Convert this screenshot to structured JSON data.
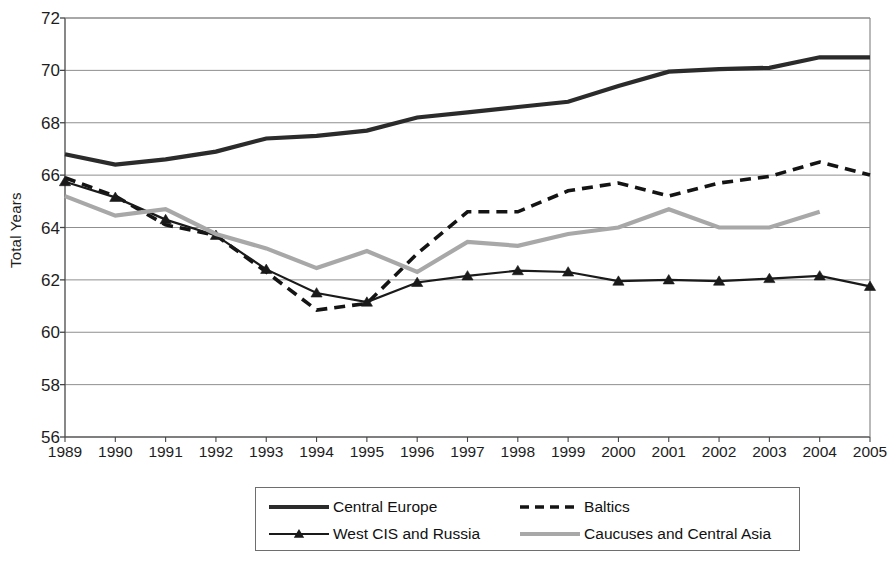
{
  "chart_data": {
    "type": "line",
    "title": "",
    "xlabel": "",
    "ylabel": "Total Years",
    "x": [
      1989,
      1990,
      1991,
      1992,
      1993,
      1994,
      1995,
      1996,
      1997,
      1998,
      1999,
      2000,
      2001,
      2002,
      2003,
      2004,
      2005
    ],
    "xlim": [
      1989,
      2005
    ],
    "ylim": [
      56,
      72
    ],
    "yticks": [
      56,
      58,
      60,
      62,
      64,
      66,
      68,
      70,
      72
    ],
    "xticks": [
      "1989",
      "1990",
      "1991",
      "1992",
      "1993",
      "1994",
      "1995",
      "1996",
      "1997",
      "1998",
      "1999",
      "2000",
      "2001",
      "2002",
      "2003",
      "2004",
      "2005"
    ],
    "grid": true,
    "legend_position": "bottom",
    "series": [
      {
        "name": "Central Europe",
        "style": "solid-thick",
        "color": "#2b2b2b",
        "marker": "none",
        "values": [
          66.8,
          66.4,
          66.6,
          66.9,
          67.4,
          67.5,
          67.7,
          68.2,
          68.4,
          68.6,
          68.8,
          69.4,
          69.95,
          70.05,
          70.1,
          70.5,
          70.5
        ]
      },
      {
        "name": "Baltics",
        "style": "dashed",
        "color": "#141414",
        "marker": "none",
        "values": [
          65.9,
          65.2,
          64.1,
          63.7,
          62.3,
          60.85,
          61.1,
          63.0,
          64.6,
          64.6,
          65.4,
          65.7,
          65.2,
          65.7,
          65.95,
          66.5,
          66.0
        ]
      },
      {
        "name": "West CIS and Russia",
        "style": "solid-marker",
        "color": "#1a1a1a",
        "marker": "triangle",
        "values": [
          65.75,
          65.15,
          64.3,
          63.7,
          62.4,
          61.5,
          61.15,
          61.9,
          62.15,
          62.35,
          62.3,
          61.95,
          62.0,
          61.95,
          62.05,
          62.15,
          61.75
        ]
      },
      {
        "name": "Caucuses and Central Asia",
        "style": "solid-gray",
        "color": "#a8a8a8",
        "marker": "none",
        "values": [
          65.2,
          64.45,
          64.7,
          63.75,
          63.2,
          62.45,
          63.1,
          62.3,
          63.45,
          63.3,
          63.75,
          64.0,
          64.7,
          64.0,
          64.0,
          64.6,
          null
        ]
      }
    ]
  },
  "axis": {
    "ylabel": "Total Years",
    "ytick_labels": [
      "72",
      "70",
      "68",
      "66",
      "64",
      "62",
      "60",
      "58",
      "56"
    ],
    "xtick_labels": [
      "1989",
      "1990",
      "1991",
      "1992",
      "1993",
      "1994",
      "1995",
      "1996",
      "1997",
      "1998",
      "1999",
      "2000",
      "2001",
      "2002",
      "2003",
      "2004",
      "2005"
    ]
  },
  "legend": {
    "entries": [
      {
        "label": "Central Europe",
        "style": "solid-thick",
        "color": "#2b2b2b"
      },
      {
        "label": "Baltics",
        "style": "dashed",
        "color": "#141414"
      },
      {
        "label": "West CIS and Russia",
        "style": "solid-marker",
        "color": "#1a1a1a"
      },
      {
        "label": "Caucuses and Central Asia",
        "style": "solid-gray",
        "color": "#a8a8a8"
      }
    ]
  },
  "colors": {
    "central_europe": "#2b2b2b",
    "baltics": "#141414",
    "west_cis": "#1a1a1a",
    "caucuses": "#a8a8a8",
    "grid": "#8f8f8f",
    "axis": "#555555",
    "background": "#ffffff"
  }
}
